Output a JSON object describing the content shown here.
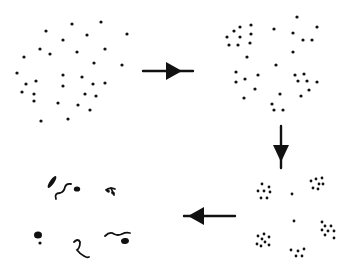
{
  "diagram": {
    "ink_color": "#111111",
    "background": "#ffffff",
    "stages": [
      {
        "id": "stage-1-dispersed",
        "label": "",
        "dot_radius": 1.6,
        "dots": [
          [
            72,
            24
          ],
          [
            101,
            22
          ],
          [
            46,
            31
          ],
          [
            87,
            35
          ],
          [
            127,
            34
          ],
          [
            63,
            40
          ],
          [
            40,
            49
          ],
          [
            50,
            54
          ],
          [
            77,
            52
          ],
          [
            105,
            49
          ],
          [
            24,
            57
          ],
          [
            94,
            63
          ],
          [
            122,
            65
          ],
          [
            17,
            73
          ],
          [
            63,
            75
          ],
          [
            82,
            77
          ],
          [
            36,
            81
          ],
          [
            26,
            84
          ],
          [
            93,
            84
          ],
          [
            105,
            83
          ],
          [
            63,
            86
          ],
          [
            22,
            92
          ],
          [
            34,
            94
          ],
          [
            85,
            94
          ],
          [
            96,
            96
          ],
          [
            34,
            101
          ],
          [
            58,
            103
          ],
          [
            78,
            105
          ],
          [
            90,
            110
          ],
          [
            41,
            121
          ],
          [
            68,
            119
          ]
        ]
      },
      {
        "id": "stage-2-grouping",
        "label": "",
        "dot_radius": 1.6,
        "dots": [
          [
            297,
            17
          ],
          [
            317,
            27
          ],
          [
            251,
            25
          ],
          [
            240,
            27
          ],
          [
            234,
            31
          ],
          [
            251,
            34
          ],
          [
            274,
            29
          ],
          [
            293,
            33
          ],
          [
            227,
            37
          ],
          [
            240,
            37
          ],
          [
            303,
            40
          ],
          [
            312,
            40
          ],
          [
            229,
            45
          ],
          [
            238,
            45
          ],
          [
            250,
            43
          ],
          [
            293,
            52
          ],
          [
            247,
            57
          ],
          [
            276,
            65
          ],
          [
            236,
            72
          ],
          [
            258,
            75
          ],
          [
            295,
            75
          ],
          [
            304,
            74
          ],
          [
            236,
            82
          ],
          [
            245,
            79
          ],
          [
            298,
            81
          ],
          [
            307,
            81
          ],
          [
            317,
            82
          ],
          [
            255,
            89
          ],
          [
            309,
            90
          ],
          [
            280,
            94
          ],
          [
            301,
            96
          ],
          [
            244,
            98
          ],
          [
            272,
            104
          ],
          [
            274,
            110
          ],
          [
            283,
            110
          ]
        ]
      },
      {
        "id": "stage-3-clusters",
        "label": "",
        "dot_radius": 1.4,
        "dots": [
          [
            262,
            184
          ],
          [
            258,
            191
          ],
          [
            264,
            191
          ],
          [
            269,
            187
          ],
          [
            270,
            192
          ],
          [
            261,
            198
          ],
          [
            267,
            198
          ],
          [
            311,
            181
          ],
          [
            316,
            179
          ],
          [
            322,
            178
          ],
          [
            319,
            184
          ],
          [
            323,
            184
          ],
          [
            313,
            188
          ],
          [
            318,
            189
          ],
          [
            292,
            194
          ],
          [
            294,
            221
          ],
          [
            322,
            222
          ],
          [
            325,
            226
          ],
          [
            331,
            226
          ],
          [
            322,
            230
          ],
          [
            328,
            231
          ],
          [
            334,
            231
          ],
          [
            325,
            235
          ],
          [
            334,
            238
          ],
          [
            258,
            236
          ],
          [
            264,
            234
          ],
          [
            269,
            237
          ],
          [
            262,
            239
          ],
          [
            265,
            242
          ],
          [
            257,
            244
          ],
          [
            261,
            246
          ],
          [
            269,
            245
          ],
          [
            291,
            250
          ],
          [
            298,
            251
          ],
          [
            304,
            249
          ],
          [
            296,
            256
          ],
          [
            302,
            256
          ]
        ]
      },
      {
        "id": "stage-4-aggregates",
        "label": "",
        "blobs": [
          {
            "type": "ellipse",
            "cx": 52,
            "cy": 182,
            "rx": 2.2,
            "ry": 7,
            "rotate": 35
          },
          {
            "type": "ellipse",
            "cx": 77,
            "cy": 189,
            "rx": 3.2,
            "ry": 2.6,
            "rotate": 0
          },
          {
            "type": "ellipse",
            "cx": 38,
            "cy": 235,
            "rx": 4,
            "ry": 3.6,
            "rotate": 0
          },
          {
            "type": "ellipse",
            "cx": 40,
            "cy": 243,
            "rx": 1.6,
            "ry": 1.6,
            "rotate": 0
          },
          {
            "type": "ellipse",
            "cx": 125,
            "cy": 241,
            "rx": 4,
            "ry": 3,
            "rotate": -10
          },
          {
            "type": "ellipse",
            "cx": 108,
            "cy": 191,
            "rx": 2,
            "ry": 1.5,
            "rotate": 30
          },
          {
            "type": "ellipse",
            "cx": 113,
            "cy": 193,
            "rx": 2,
            "ry": 1.5,
            "rotate": 30
          }
        ],
        "strokes": [
          "M56 199 Q54 193 60 193 Q64 192 65 187 Q66 183 71 184",
          "M106 190 Q110 187 115 189",
          "M111 188 L114 195",
          "M74 242 Q78 238 80 242 Q80 248 77 250 Q80 254 84 256 Q87 258 89 257",
          "M105 236 Q110 231 114 234 Q118 236 122 234 Q126 232 130 233"
        ]
      }
    ],
    "arrows": [
      {
        "id": "arrow-1-to-2",
        "direction": "right",
        "x1": 143,
        "y1": 71,
        "x2": 193,
        "y2": 71,
        "head_at": [
          170,
          71
        ]
      },
      {
        "id": "arrow-2-to-3",
        "direction": "down",
        "x1": 281,
        "y1": 126,
        "x2": 281,
        "y2": 168,
        "head_at": [
          281,
          150
        ]
      },
      {
        "id": "arrow-3-to-4",
        "direction": "left",
        "x1": 235,
        "y1": 216,
        "x2": 184,
        "y2": 216,
        "head_at": [
          200,
          216
        ]
      }
    ]
  }
}
